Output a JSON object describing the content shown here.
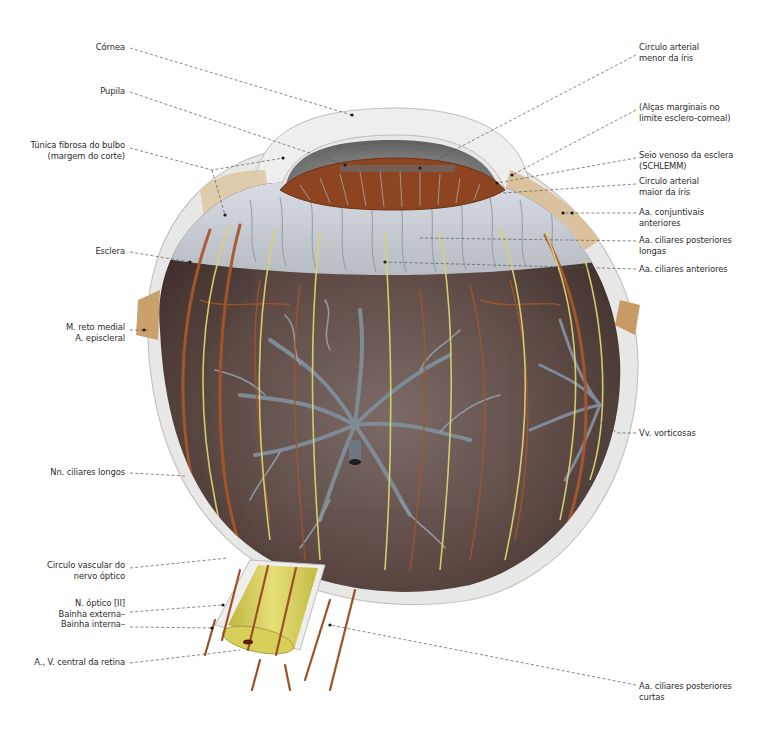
{
  "figure": {
    "colors": {
      "background": "#ffffff",
      "sclera": "#e6e6e4",
      "sclera_edge": "#c9c9c6",
      "choroid": "#6b5a55",
      "choroid_dark": "#3f302d",
      "cornea_chamber": "#8c8c8c",
      "iris_vessels": "#9a4a22",
      "artery": "#b4622f",
      "vein_gray": "#8e9aa6",
      "nerve_yellow": "#d8d46a",
      "optic_nerve": "#d9d25a",
      "tendon": "#d8c09a",
      "leader_line": "#555555"
    }
  },
  "labels": {
    "left": [
      {
        "id": "cornea",
        "text": "Córnea"
      },
      {
        "id": "pupila",
        "text": "Pupila"
      },
      {
        "id": "tunica_fibrosa",
        "text": "Túnica fibrosa do bulbo\n(margem do corte)"
      },
      {
        "id": "esclera",
        "text": "Esclera"
      },
      {
        "id": "reto_medial",
        "text": "M. reto medial\nA. episcleral"
      },
      {
        "id": "nn_ciliares_longos",
        "text": "Nn. ciliares longos"
      },
      {
        "id": "circulo_vascular",
        "text": "Circulo vascular do\nnervo óptico"
      },
      {
        "id": "nervo_optico",
        "text": "N. óptico [II]\nBainha externa–\nBainha interna–"
      },
      {
        "id": "av_central",
        "text": "A., V. central da retina"
      }
    ],
    "right": [
      {
        "id": "circulo_menor",
        "text": "Circulo arterial\nmenor da íris"
      },
      {
        "id": "alcas_marginais",
        "text": "(Alças marginais no\nlimite esclero-corneal)"
      },
      {
        "id": "seio_venoso",
        "text": "Seio venoso da esclera\n(SCHLEMM)"
      },
      {
        "id": "circulo_maior",
        "text": "Circulo arterial\nmaior da íris"
      },
      {
        "id": "aa_conjuntivais",
        "text": "Aa. conjuntivais\nanteriores"
      },
      {
        "id": "aa_ciliares_post_longas",
        "text": "Aa. ciliares posteriores\nlongas"
      },
      {
        "id": "aa_ciliares_anteriores",
        "text": "Aa. ciliares anteriores"
      },
      {
        "id": "vv_vorticosas",
        "text": "Vv. vorticosas"
      },
      {
        "id": "aa_ciliares_post_curtas",
        "text": "Aa. ciliares posteriores\ncurtas"
      }
    ]
  }
}
